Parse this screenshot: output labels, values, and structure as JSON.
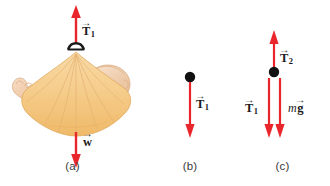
{
  "figure": {
    "background": "#ffffff",
    "arrow_color": "#e8262c",
    "dot_color": "#111111",
    "sling_color": "#f5c97e",
    "skin_color": "#f2cfae",
    "width": 330,
    "height": 186
  },
  "panels": [
    {
      "id": "a",
      "caption": "(a)",
      "description": "Illustration of a baby lying in a cloth sling hung from a hook",
      "labels": [
        {
          "name": "tension-1",
          "symbol": "T",
          "subscript": "1",
          "prefix": "",
          "vector": true,
          "direction": "up"
        },
        {
          "name": "weight",
          "symbol": "w",
          "subscript": "",
          "prefix": "",
          "vector": true,
          "direction": "down"
        }
      ]
    },
    {
      "id": "b",
      "caption": "(b)",
      "description": "Free-body diagram: point mass with one downward tension force",
      "labels": [
        {
          "name": "tension-1",
          "symbol": "T",
          "subscript": "1",
          "prefix": "",
          "vector": true,
          "direction": "down"
        }
      ]
    },
    {
      "id": "c",
      "caption": "(c)",
      "description": "Free-body diagram: point mass with upward tension T2 and downward tension T1 and weight mg",
      "labels": [
        {
          "name": "tension-2",
          "symbol": "T",
          "subscript": "2",
          "prefix": "",
          "vector": true,
          "direction": "up"
        },
        {
          "name": "tension-1",
          "symbol": "T",
          "subscript": "1",
          "prefix": "",
          "vector": true,
          "direction": "down"
        },
        {
          "name": "weight-mg",
          "symbol": "g",
          "subscript": "",
          "prefix": "m",
          "vector": true,
          "direction": "down"
        }
      ]
    }
  ],
  "glyphs": {
    "vector_arrow": "→",
    "T": "T",
    "w": "w",
    "g": "g",
    "m": "m",
    "sub1": "1",
    "sub2": "2"
  }
}
